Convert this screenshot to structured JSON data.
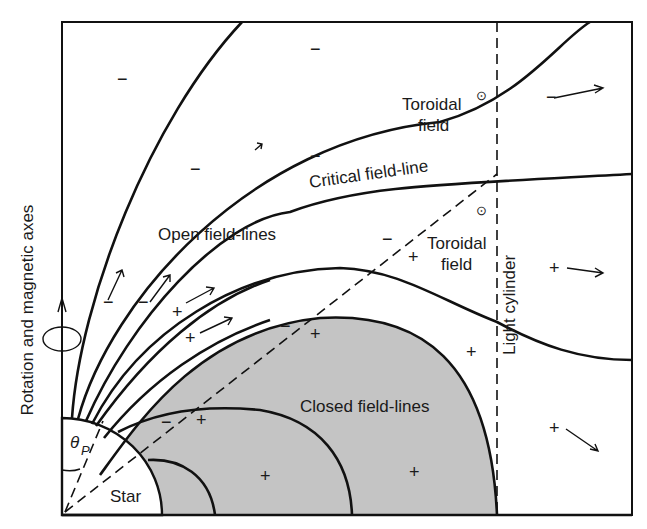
{
  "diagram": {
    "colors": {
      "line": "#111111",
      "closed_region_fill": "#c4c4c4",
      "background": "#ffffff"
    },
    "labels": {
      "axis": "Rotation and magnetic axes",
      "light_cylinder": "Light cylinder",
      "critical": "Critical field-line",
      "open": "Open field-lines",
      "closed": "Closed field-lines",
      "toroidal_upper_1": "Toroidal",
      "toroidal_upper_2": "field",
      "toroidal_lower_1": "Toroidal",
      "toroidal_lower_2": "field",
      "star": "Star",
      "theta": "θ",
      "theta_sub": "P"
    },
    "symbols": {
      "minus": "−",
      "plus": "+",
      "out_of_page": "⊙"
    }
  }
}
